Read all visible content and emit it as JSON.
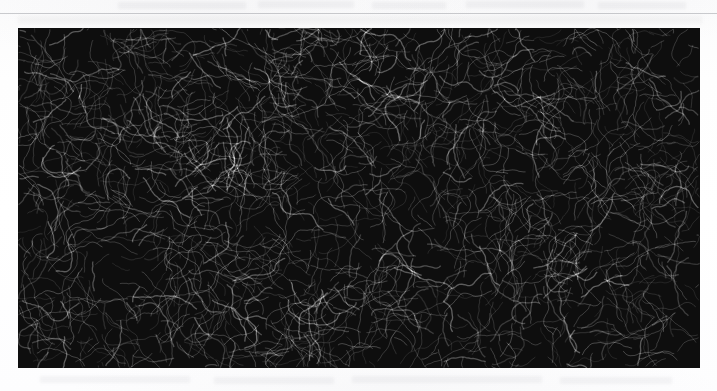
{
  "page": {
    "width": 717,
    "height": 391,
    "background_color": "#fdfdfd",
    "kind": "scanned-page-excerpt"
  },
  "rule": {
    "name": "top-horizontal-rule",
    "color": "#787c84",
    "y": 13,
    "thickness_px": 1
  },
  "ghost_text_rows": [
    {
      "x": 118,
      "y": 2,
      "width": 128
    },
    {
      "x": 258,
      "y": 1,
      "width": 96
    },
    {
      "x": 372,
      "y": 2,
      "width": 74
    },
    {
      "x": 466,
      "y": 1,
      "width": 118
    },
    {
      "x": 598,
      "y": 2,
      "width": 88
    },
    {
      "x": 40,
      "y": 376,
      "width": 150
    },
    {
      "x": 214,
      "y": 377,
      "width": 120
    },
    {
      "x": 352,
      "y": 376,
      "width": 190
    },
    {
      "x": 560,
      "y": 377,
      "width": 112
    }
  ],
  "figure": {
    "name": "large-scale-structure-panel",
    "caption": "",
    "x": 18,
    "y": 28,
    "width": 682,
    "height": 340,
    "tone": "monochrome",
    "background_color": "#0e0e0e",
    "filament_color": "#f0f0f0",
    "has_axes": false,
    "has_tick_labels": false,
    "has_legend": false,
    "visible_text": ""
  }
}
